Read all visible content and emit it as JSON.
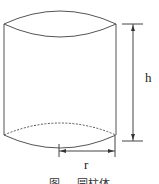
{
  "figure": {
    "type": "cylinder-diagram",
    "labels": {
      "height": "h",
      "radius": "r"
    },
    "caption": "图 … 圆柱体",
    "colors": {
      "stroke": "#555555",
      "background": "#ffffff"
    }
  }
}
